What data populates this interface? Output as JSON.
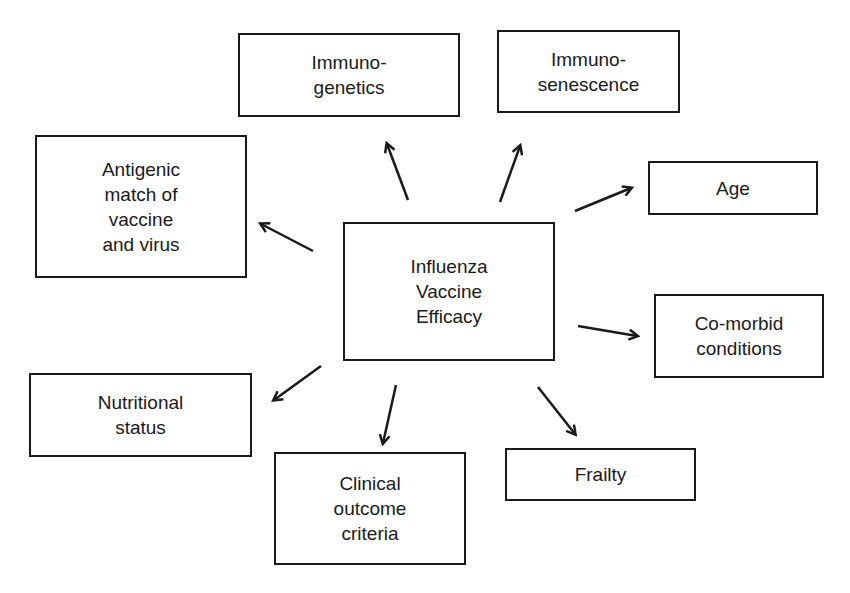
{
  "diagram": {
    "center": {
      "label": "Influenza\nVaccine\nEfficacy"
    },
    "factors": [
      {
        "id": "immunogenetics",
        "label": "Immuno-\ngenetics"
      },
      {
        "id": "immunosenescence",
        "label": "Immuno-\nsenescence"
      },
      {
        "id": "antigenic-match",
        "label": "Antigenic\nmatch of\nvaccine\nand virus"
      },
      {
        "id": "age",
        "label": "Age"
      },
      {
        "id": "comorbid",
        "label": "Co-morbid\nconditions"
      },
      {
        "id": "nutritional",
        "label": "Nutritional\nstatus"
      },
      {
        "id": "clinical-outcome",
        "label": "Clinical\noutcome\ncriteria"
      },
      {
        "id": "frailty",
        "label": "Frailty"
      }
    ],
    "colors": {
      "stroke": "#1a1a1a",
      "background": "#ffffff"
    }
  }
}
